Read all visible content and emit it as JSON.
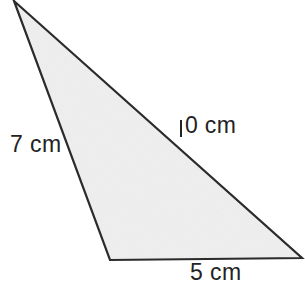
{
  "figure": {
    "kind": "geometry-diagram",
    "shape": "triangle",
    "background_color": "#ffffff",
    "fill_color": "#efefef",
    "stroke_color": "#2b2b2b",
    "stroke_width": 2.2,
    "text_color": "#232323",
    "width": 305,
    "height": 288,
    "vertices": [
      {
        "name": "apex",
        "x": 14,
        "y": 1
      },
      {
        "name": "bottom-left",
        "x": 110,
        "y": 260
      },
      {
        "name": "bottom-right",
        "x": 302,
        "y": 258
      }
    ],
    "polygon_points": "14,1 302,258 110,260",
    "unit": "cm",
    "labels": [
      {
        "id": "side-7",
        "side": "left",
        "text": "7 cm",
        "value": 7,
        "unit": "cm",
        "from_vertex": "apex",
        "to_vertex": "bottom-left"
      },
      {
        "id": "side-10",
        "side": "hypotenuse",
        "text": "10 cm",
        "value": 10,
        "unit": "cm",
        "leading_digit": "1",
        "trailing_text": "0 cm",
        "from_vertex": "apex",
        "to_vertex": "bottom-right"
      },
      {
        "id": "side-5",
        "side": "base",
        "text": "5 cm",
        "value": 5,
        "unit": "cm",
        "from_vertex": "bottom-left",
        "to_vertex": "bottom-right"
      }
    ]
  }
}
